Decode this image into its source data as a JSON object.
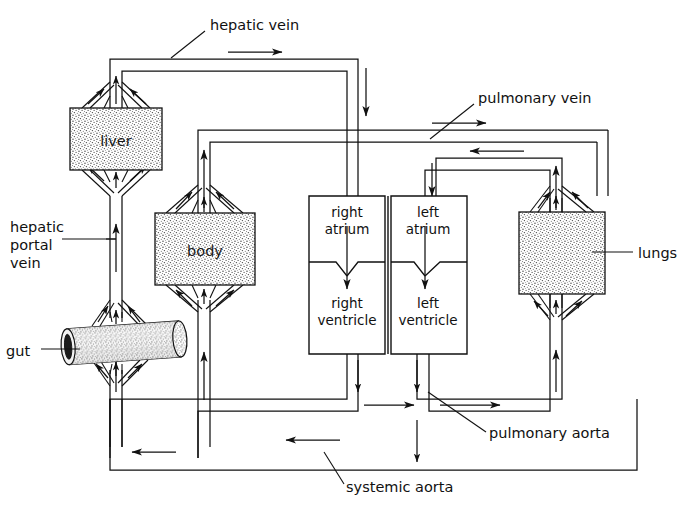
{
  "diagram": {
    "background_color": "#ffffff",
    "line_color": "#111111",
    "organ_fill": "#d8d8d8"
  },
  "organs": [
    {
      "id": "liver",
      "label": "liver",
      "shape": "stippled-box",
      "x": 70,
      "y": 108,
      "w": 92,
      "h": 62
    },
    {
      "id": "body",
      "label": "body",
      "shape": "stippled-box",
      "x": 155,
      "y": 213,
      "w": 100,
      "h": 72
    },
    {
      "id": "gut",
      "label": "gut",
      "shape": "stippled-cylinder",
      "x": 62,
      "y": 325,
      "w": 120,
      "h": 38
    },
    {
      "id": "lungs",
      "label": "lungs",
      "shape": "stippled-box",
      "x": 519,
      "y": 212,
      "w": 86,
      "h": 82
    }
  ],
  "heart": {
    "chambers": [
      {
        "id": "right-atrium",
        "label_line1": "right",
        "label_line2": "atrium"
      },
      {
        "id": "left-atrium",
        "label_line1": "left",
        "label_line2": "atrium"
      },
      {
        "id": "right-ventricle",
        "label_line1": "right",
        "label_line2": "ventricle"
      },
      {
        "id": "left-ventricle",
        "label_line1": "left",
        "label_line2": "ventricle"
      }
    ]
  },
  "vessel_labels": [
    {
      "id": "hepatic-vein",
      "text": "hepatic vein",
      "x": 210,
      "y": 34,
      "lines": [
        "hepatic vein"
      ]
    },
    {
      "id": "pulmonary-vein",
      "text": "pulmonary vein",
      "x": 478,
      "y": 108,
      "lines": [
        "pulmonary vein"
      ]
    },
    {
      "id": "hepatic-portal-vein",
      "text": "hepatic portal vein",
      "x": 12,
      "y": 232,
      "lines": [
        "hepatic",
        "portal",
        "vein"
      ]
    },
    {
      "id": "gut-label",
      "text": "gut",
      "x": 8,
      "y": 355,
      "lines": [
        "gut"
      ]
    },
    {
      "id": "lungs-label",
      "text": "lungs",
      "x": 638,
      "y": 263,
      "lines": [
        "lungs"
      ]
    },
    {
      "id": "pulmonary-aorta",
      "text": "pulmonary aorta",
      "x": 489,
      "y": 440,
      "lines": [
        "pulmonary aorta"
      ]
    },
    {
      "id": "systemic-aorta",
      "text": "systemic aorta",
      "x": 346,
      "y": 491,
      "lines": [
        "systemic aorta"
      ]
    }
  ],
  "organ_labels": {
    "liver": "liver",
    "body": "body",
    "lungs": "lungs",
    "gut": "gut"
  },
  "heart_labels": {
    "right_atrium_1": "right",
    "right_atrium_2": "atrium",
    "left_atrium_1": "left",
    "left_atrium_2": "atrium",
    "right_ventricle_1": "right",
    "right_ventricle_2": "ventricle",
    "left_ventricle_1": "left",
    "left_ventricle_2": "ventricle"
  }
}
